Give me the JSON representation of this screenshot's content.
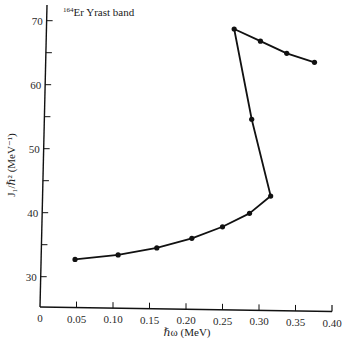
{
  "chart_data": {
    "type": "line",
    "title": "",
    "annotation": {
      "isotope_mass": "164",
      "text": "Er Yrast band"
    },
    "xlabel": "ℏω (MeV)",
    "ylabel": "J₁/ℏ² (MeV⁻¹)",
    "xlim": [
      0,
      0.4
    ],
    "ylim": [
      25,
      72
    ],
    "x_ticks": [
      "0",
      "0.05",
      "0.10",
      "0.15",
      "0.20",
      "0.25",
      "0.30",
      "0.35",
      "0.40"
    ],
    "y_ticks": [
      "30",
      "40",
      "50",
      "60",
      "70"
    ],
    "y_minor_ticks": [
      35,
      45,
      55,
      65
    ],
    "grid": false,
    "legend": null,
    "series": [
      {
        "name": "164Er Yrast band",
        "marker": "circle",
        "color": "#111111",
        "points": [
          {
            "x": 0.048,
            "y": 32.7
          },
          {
            "x": 0.107,
            "y": 33.4
          },
          {
            "x": 0.16,
            "y": 34.5
          },
          {
            "x": 0.208,
            "y": 36.0
          },
          {
            "x": 0.25,
            "y": 37.8
          },
          {
            "x": 0.287,
            "y": 39.9
          },
          {
            "x": 0.316,
            "y": 42.6
          },
          {
            "x": 0.29,
            "y": 54.6
          },
          {
            "x": 0.266,
            "y": 68.7
          },
          {
            "x": 0.302,
            "y": 66.8
          },
          {
            "x": 0.338,
            "y": 64.9
          },
          {
            "x": 0.376,
            "y": 63.5
          }
        ]
      }
    ]
  }
}
